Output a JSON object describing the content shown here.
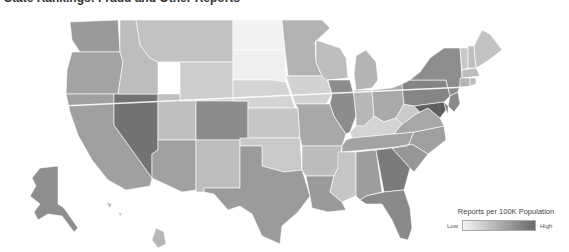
{
  "title": "State Rankings: Fraud and Other Reports",
  "legend": {
    "title": "Reports per 100K Population",
    "low_label": "Low",
    "high_label": "High",
    "low_color": "#f4f4f4",
    "high_color": "#6a6a6a"
  },
  "chart_data": {
    "type": "choropleth",
    "title": "State Rankings: Fraud and Other Reports",
    "legend_title": "Reports per 100K Population",
    "scale": [
      "Low",
      "High"
    ],
    "palette": "grayscale (light = low, dark = high)",
    "states": [
      {
        "id": "WA",
        "shade": "#9a9a9a",
        "d": "M70,22 L118,20 L120,52 L80,52 L72,40 Z"
      },
      {
        "id": "OR",
        "shade": "#a3a3a3",
        "d": "M72,52 L120,52 L123,62 L118,94 L66,94 L67,70 Z"
      },
      {
        "id": "CA",
        "shade": "#a0a0a0",
        "d": "M66,94 L114,94 L114,125 L152,178 L150,186 L126,190 L108,180 L92,160 L78,135 L70,112 Z"
      },
      {
        "id": "NV",
        "shade": "#737373",
        "d": "M114,94 L158,94 L158,150 L152,154 L152,178 L114,125 Z"
      },
      {
        "id": "ID",
        "shade": "#bdbdbd",
        "d": "M120,20 L136,20 L140,45 L150,58 L158,62 L158,94 L118,94 L123,62 L120,52 Z"
      },
      {
        "id": "MT",
        "shade": "#c2c2c2",
        "d": "M136,20 L233,20 L233,62 L158,62 L150,58 L140,45 Z"
      },
      {
        "id": "WY",
        "shade": "#cecece",
        "d": "M180,62 L233,62 L233,101 L180,101 Z"
      },
      {
        "id": "UT",
        "shade": "#bfbfbf",
        "d": "M158,94 L180,94 L180,101 L196,101 L196,140 L158,140 Z"
      },
      {
        "id": "CO",
        "shade": "#8c8c8c",
        "d": "M196,101 L248,101 L248,140 L196,140 Z"
      },
      {
        "id": "AZ",
        "shade": "#a1a1a1",
        "d": "M158,140 L196,140 L196,190 L182,192 L152,178 L152,154 L158,150 Z"
      },
      {
        "id": "NM",
        "shade": "#bdbdbd",
        "d": "M196,140 L240,140 L240,188 L204,188 L204,192 L196,192 Z"
      },
      {
        "id": "ND",
        "shade": "#f2f2f2",
        "d": "M233,20 L282,20 L285,50 L233,50 Z"
      },
      {
        "id": "SD",
        "shade": "#efefef",
        "d": "M233,50 L285,50 L286,82 L272,80 L233,80 Z"
      },
      {
        "id": "NE",
        "shade": "#d4d4d4",
        "d": "M233,80 L272,80 L286,82 L295,108 L248,108 L248,101 L233,101 Z"
      },
      {
        "id": "KS",
        "shade": "#c6c6c6",
        "d": "M248,108 L298,108 L300,138 L248,138 Z"
      },
      {
        "id": "OK",
        "shade": "#c9c9c9",
        "d": "M240,138 L300,138 L302,170 L284,172 L262,166 L262,146 L240,146 Z"
      },
      {
        "id": "TX",
        "shade": "#9b9b9b",
        "d": "M240,146 L262,146 L262,166 L284,172 L302,170 L310,196 L298,212 L282,226 L280,244 L262,236 L252,214 L240,206 L228,210 L214,194 L204,192 L204,188 L240,188 Z"
      },
      {
        "id": "MN",
        "shade": "#b3b3b3",
        "d": "M282,20 L322,20 L330,28 L315,42 L316,62 L322,76 L288,76 L285,50 Z"
      },
      {
        "id": "IA",
        "shade": "#d2d2d2",
        "d": "M286,76 L326,76 L332,94 L326,104 L295,104 Z"
      },
      {
        "id": "MO",
        "shade": "#a8a8a8",
        "d": "M295,104 L330,104 L334,116 L346,134 L342,146 L302,146 L300,138 L298,108 Z"
      },
      {
        "id": "AR",
        "shade": "#bcbcbc",
        "d": "M302,146 L342,146 L338,168 L334,176 L306,176 L302,170 Z"
      },
      {
        "id": "LA",
        "shade": "#9a9a9a",
        "d": "M306,176 L334,176 L330,192 L342,202 L346,210 L328,212 L312,208 L310,196 Z"
      },
      {
        "id": "WI",
        "shade": "#bdbdbd",
        "d": "M316,40 L340,48 L346,58 L348,78 L326,80 L322,76 L316,62 Z"
      },
      {
        "id": "IL",
        "shade": "#8c8c8c",
        "d": "M328,80 L350,80 L354,96 L356,116 L350,132 L346,134 L334,116 L330,104 L332,94 Z"
      },
      {
        "id": "MI",
        "shade": "#b4b4b4",
        "d": "M356,56 L366,50 L376,62 L378,80 L372,88 L356,90 L354,74 Z"
      },
      {
        "id": "IN",
        "shade": "#b7b7b7",
        "d": "M354,90 L372,90 L374,116 L364,126 L356,126 L356,116 L354,96 Z"
      },
      {
        "id": "OH",
        "shade": "#a9a9a9",
        "d": "M372,90 L392,88 L402,84 L404,104 L396,118 L384,122 L374,116 Z"
      },
      {
        "id": "KY",
        "shade": "#d3d3d3",
        "d": "M350,132 L356,126 L364,126 L374,116 L384,122 L396,118 L402,124 L394,134 L352,138 Z"
      },
      {
        "id": "TN",
        "shade": "#a3a3a3",
        "d": "M342,146 L346,140 L352,138 L394,134 L414,132 L408,146 L342,152 Z"
      },
      {
        "id": "MS",
        "shade": "#c5c5c5",
        "d": "M338,152 L356,152 L356,196 L346,200 L342,202 L330,192 L334,176 L338,168 Z"
      },
      {
        "id": "AL",
        "shade": "#9d9d9d",
        "d": "M356,152 L376,150 L382,192 L366,196 L360,200 L356,196 Z"
      },
      {
        "id": "GA",
        "shade": "#7b7b7b",
        "d": "M376,150 L392,148 L410,168 L404,190 L384,192 Z"
      },
      {
        "id": "FL",
        "shade": "#8a8a8a",
        "d": "M360,200 L366,196 L384,192 L404,190 L410,208 L412,228 L408,240 L400,238 L392,220 L382,204 L366,204 Z"
      },
      {
        "id": "SC",
        "shade": "#969696",
        "d": "M392,148 L412,144 L428,154 L414,172 L410,168 Z"
      },
      {
        "id": "NC",
        "shade": "#9f9f9f",
        "d": "M408,146 L414,132 L444,126 L446,140 L428,154 L412,144 L392,148 Z"
      },
      {
        "id": "VA",
        "shade": "#a7a7a7",
        "d": "M394,134 L402,124 L416,114 L428,108 L440,118 L444,126 L414,132 Z"
      },
      {
        "id": "WV",
        "shade": "#c9c9c9",
        "d": "M396,118 L404,104 L414,106 L420,112 L416,114 L402,124 Z"
      },
      {
        "id": "PA",
        "shade": "#858585",
        "d": "M402,84 L410,80 L446,80 L450,96 L444,102 L414,106 L404,104 Z"
      },
      {
        "id": "NY",
        "shade": "#8d8d8d",
        "d": "M410,80 L420,72 L430,58 L444,48 L460,48 L462,78 L458,92 L450,96 L446,80 Z"
      },
      {
        "id": "NJ",
        "shade": "#8a8a8a",
        "d": "M450,96 L458,92 L460,104 L454,112 L448,106 Z"
      },
      {
        "id": "MD",
        "shade": "#5f5f5f",
        "d": "M414,106 L444,102 L446,110 L440,118 L428,108 L420,112 Z"
      },
      {
        "id": "DE",
        "shade": "#7a7a7a",
        "d": "M444,102 L448,106 L448,114 L446,110 Z"
      },
      {
        "id": "VT",
        "shade": "#c8c8c8",
        "d": "M460,48 L468,48 L468,68 L462,70 Z"
      },
      {
        "id": "NH",
        "shade": "#bfbfbf",
        "d": "M468,46 L474,46 L476,68 L468,68 Z"
      },
      {
        "id": "ME",
        "shade": "#c2c2c2",
        "d": "M474,46 L482,30 L490,34 L502,50 L486,62 L476,68 Z"
      },
      {
        "id": "MA",
        "shade": "#bdbdbd",
        "d": "M462,70 L476,68 L480,76 L462,78 Z"
      },
      {
        "id": "CT",
        "shade": "#b3b3b3",
        "d": "M460,78 L470,78 L470,86 L460,88 Z"
      },
      {
        "id": "RI",
        "shade": "#bbbbbb",
        "d": "M470,78 L476,78 L476,84 L470,86 Z"
      },
      {
        "id": "AK",
        "shade": "#8e8e8e",
        "d": "M40,168 L58,166 L58,204 L64,208 L78,228 L74,232 L62,216 L48,214 L38,220 L34,212 L40,204 L30,196 L36,186 L32,178 Z"
      },
      {
        "id": "HI",
        "shade": "#b7b7b7",
        "d": "M106,202 L112,204 L110,208 Z M118,212 L122,214 L120,216 Z M156,228 L164,232 L166,244 L158,248 L152,240 Z"
      }
    ]
  }
}
